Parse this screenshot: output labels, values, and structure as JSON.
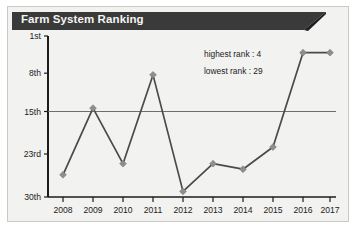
{
  "card": {
    "title": "Farm System Ranking",
    "banner_color": "#3a3a3a",
    "background_color": "#f2f2f0",
    "border_color": "#c9c9c6"
  },
  "annotations": {
    "highest": "highest rank : 4",
    "lowest": "lowest rank : 29"
  },
  "chart_data": {
    "type": "line",
    "title": "Farm System Ranking",
    "xlabel": "",
    "ylabel": "",
    "x": [
      "2008",
      "2009",
      "2010",
      "2011",
      "2012",
      "2013",
      "2014",
      "2015",
      "2016",
      "2017"
    ],
    "categories": [
      "2008",
      "2009",
      "2010",
      "2011",
      "2012",
      "2013",
      "2014",
      "2015",
      "2016",
      "2017"
    ],
    "values": [
      26,
      14,
      24,
      8,
      29,
      24,
      25,
      21,
      4,
      4
    ],
    "series": [
      {
        "name": "Farm System Ranking",
        "values": [
          26,
          14,
          24,
          8,
          29,
          24,
          25,
          21,
          4,
          4
        ]
      }
    ],
    "ytick_labels": [
      "1st",
      "8th",
      "15th",
      "23rd",
      "30th"
    ],
    "ytick_values": [
      1,
      8,
      15,
      23,
      30
    ],
    "ylim": [
      1,
      30
    ],
    "y_inverted": true,
    "xtick_labels": [
      "2008",
      "2009",
      "2010",
      "2011",
      "2012",
      "2013",
      "2014",
      "2015",
      "2016",
      "2017"
    ],
    "reference_line": {
      "value": 15,
      "label": "15th"
    },
    "grid": false,
    "legend": "none",
    "line_color": "#4a4a4a",
    "marker_color": "#8e8e8e",
    "annotations": [
      "highest rank : 4",
      "lowest rank : 29"
    ],
    "highest_rank": 4,
    "lowest_rank": 29
  }
}
